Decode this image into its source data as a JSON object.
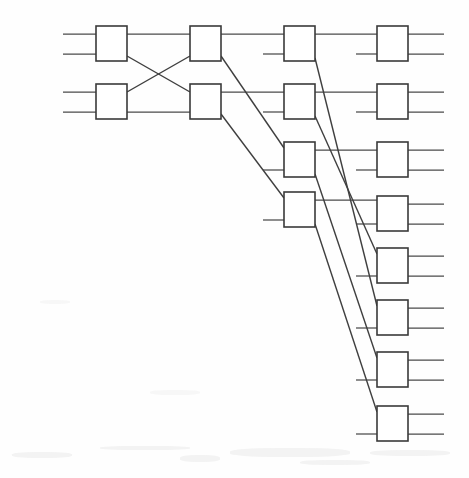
{
  "diagram": {
    "type": "switching-network",
    "background_color": "#fefefe",
    "line_color": "#4a4a4a",
    "box_stroke_color": "#3a3a3a",
    "box_fill_color": "#ffffff",
    "canvas": {
      "width": 469,
      "height": 478
    },
    "box_size": {
      "width": 31,
      "height": 35
    },
    "stub_length": 33,
    "columns": [
      {
        "name": "stage-1",
        "index": 1,
        "x": 96,
        "node_count": 2,
        "nodes": [
          {
            "id": "s1n1",
            "label": "",
            "x": 96,
            "y": 26
          },
          {
            "id": "s1n2",
            "label": "",
            "x": 96,
            "y": 84
          }
        ]
      },
      {
        "name": "stage-2",
        "index": 2,
        "x": 190,
        "node_count": 2,
        "nodes": [
          {
            "id": "s2n1",
            "label": "",
            "x": 190,
            "y": 26
          },
          {
            "id": "s2n2",
            "label": "",
            "x": 190,
            "y": 84
          }
        ]
      },
      {
        "name": "stage-3",
        "index": 3,
        "x": 284,
        "node_count": 4,
        "nodes": [
          {
            "id": "s3n1",
            "label": "",
            "x": 284,
            "y": 26
          },
          {
            "id": "s3n2",
            "label": "",
            "x": 284,
            "y": 84
          },
          {
            "id": "s3n3",
            "label": "",
            "x": 284,
            "y": 142
          },
          {
            "id": "s3n4",
            "label": "",
            "x": 284,
            "y": 192
          }
        ]
      },
      {
        "name": "stage-4",
        "index": 4,
        "x": 377,
        "node_count": 8,
        "nodes": [
          {
            "id": "s4n1",
            "label": "",
            "x": 377,
            "y": 26
          },
          {
            "id": "s4n2",
            "label": "",
            "x": 377,
            "y": 84
          },
          {
            "id": "s4n3",
            "label": "",
            "x": 377,
            "y": 142
          },
          {
            "id": "s4n4",
            "label": "",
            "x": 377,
            "y": 196
          },
          {
            "id": "s4n5",
            "label": "",
            "x": 377,
            "y": 248
          },
          {
            "id": "s4n6",
            "label": "",
            "x": 377,
            "y": 300
          },
          {
            "id": "s4n7",
            "label": "",
            "x": 377,
            "y": 352
          },
          {
            "id": "s4n8",
            "label": "",
            "x": 377,
            "y": 406
          }
        ]
      }
    ],
    "input_stubs": [
      {
        "name": "input-1a",
        "x1": 63,
        "y1": 34,
        "x2": 96,
        "y2": 34
      },
      {
        "name": "input-1b",
        "x1": 63,
        "y1": 54,
        "x2": 96,
        "y2": 54
      },
      {
        "name": "input-2a",
        "x1": 63,
        "y1": 92,
        "x2": 96,
        "y2": 92
      },
      {
        "name": "input-2b",
        "x1": 63,
        "y1": 112,
        "x2": 96,
        "y2": 112
      }
    ],
    "output_stubs": [
      {
        "name": "output-1a",
        "x1": 408,
        "y1": 34,
        "x2": 444,
        "y2": 34
      },
      {
        "name": "output-1b",
        "x1": 408,
        "y1": 54,
        "x2": 444,
        "y2": 54
      },
      {
        "name": "output-2a",
        "x1": 408,
        "y1": 92,
        "x2": 444,
        "y2": 92
      },
      {
        "name": "output-2b",
        "x1": 408,
        "y1": 112,
        "x2": 444,
        "y2": 112
      },
      {
        "name": "output-3a",
        "x1": 408,
        "y1": 150,
        "x2": 444,
        "y2": 150
      },
      {
        "name": "output-3b",
        "x1": 408,
        "y1": 170,
        "x2": 444,
        "y2": 170
      },
      {
        "name": "output-4a",
        "x1": 408,
        "y1": 204,
        "x2": 444,
        "y2": 204
      },
      {
        "name": "output-4b",
        "x1": 408,
        "y1": 224,
        "x2": 444,
        "y2": 224
      },
      {
        "name": "output-5a",
        "x1": 408,
        "y1": 256,
        "x2": 444,
        "y2": 256
      },
      {
        "name": "output-5b",
        "x1": 408,
        "y1": 276,
        "x2": 444,
        "y2": 276
      },
      {
        "name": "output-6a",
        "x1": 408,
        "y1": 308,
        "x2": 444,
        "y2": 308
      },
      {
        "name": "output-6b",
        "x1": 408,
        "y1": 328,
        "x2": 444,
        "y2": 328
      },
      {
        "name": "output-7a",
        "x1": 408,
        "y1": 360,
        "x2": 444,
        "y2": 360
      },
      {
        "name": "output-7b",
        "x1": 408,
        "y1": 380,
        "x2": 444,
        "y2": 380
      },
      {
        "name": "output-8a",
        "x1": 408,
        "y1": 414,
        "x2": 444,
        "y2": 414
      },
      {
        "name": "output-8b",
        "x1": 408,
        "y1": 434,
        "x2": 444,
        "y2": 434
      }
    ],
    "straight_links": [
      {
        "name": "link-s1n1-s2n1",
        "from": "s1n1",
        "to": "s2n1",
        "x1": 127,
        "y1": 34,
        "x2": 190,
        "y2": 34
      },
      {
        "name": "link-s1n2-s2n2",
        "from": "s1n2",
        "to": "s2n2",
        "x1": 127,
        "y1": 112,
        "x2": 190,
        "y2": 112
      },
      {
        "name": "link-s2n1-s3n1",
        "from": "s2n1",
        "to": "s3n1",
        "x1": 221,
        "y1": 34,
        "x2": 284,
        "y2": 34
      },
      {
        "name": "link-s2n2-s3n2",
        "from": "s2n2",
        "to": "s3n2",
        "x1": 221,
        "y1": 92,
        "x2": 284,
        "y2": 92
      },
      {
        "name": "link-s3n1-s4n1",
        "from": "s3n1",
        "to": "s4n1",
        "x1": 315,
        "y1": 34,
        "x2": 377,
        "y2": 34
      },
      {
        "name": "link-s3n2-s4n2",
        "from": "s3n2",
        "to": "s4n2",
        "x1": 315,
        "y1": 92,
        "x2": 377,
        "y2": 92
      },
      {
        "name": "link-s3n3-s4n3",
        "from": "s3n3",
        "to": "s4n3",
        "x1": 315,
        "y1": 150,
        "x2": 377,
        "y2": 150
      },
      {
        "name": "link-s3n4-s4n4",
        "from": "s3n4",
        "to": "s4n4",
        "x1": 315,
        "y1": 200,
        "x2": 377,
        "y2": 200
      },
      {
        "name": "stub-s3n1-in",
        "from": "",
        "to": "s3n1",
        "x1": 263,
        "y1": 54,
        "x2": 284,
        "y2": 54
      },
      {
        "name": "stub-s3n2-in",
        "from": "",
        "to": "s3n2",
        "x1": 263,
        "y1": 112,
        "x2": 284,
        "y2": 112
      },
      {
        "name": "stub-s3n3-in",
        "from": "",
        "to": "s3n3",
        "x1": 263,
        "y1": 170,
        "x2": 284,
        "y2": 170
      },
      {
        "name": "stub-s3n4-in",
        "from": "",
        "to": "s3n4",
        "x1": 263,
        "y1": 220,
        "x2": 284,
        "y2": 220
      },
      {
        "name": "stub-s4n1-in",
        "from": "",
        "to": "s4n1",
        "x1": 356,
        "y1": 54,
        "x2": 377,
        "y2": 54
      },
      {
        "name": "stub-s4n2-in",
        "from": "",
        "to": "s4n2",
        "x1": 356,
        "y1": 112,
        "x2": 377,
        "y2": 112
      },
      {
        "name": "stub-s4n3-in",
        "from": "",
        "to": "s4n3",
        "x1": 356,
        "y1": 170,
        "x2": 377,
        "y2": 170
      },
      {
        "name": "stub-s4n4-in",
        "from": "",
        "to": "s4n4",
        "x1": 356,
        "y1": 224,
        "x2": 377,
        "y2": 224
      },
      {
        "name": "stub-s4n5-in",
        "from": "",
        "to": "s4n5",
        "x1": 356,
        "y1": 276,
        "x2": 377,
        "y2": 276
      },
      {
        "name": "stub-s4n6-in",
        "from": "",
        "to": "s4n6",
        "x1": 356,
        "y1": 328,
        "x2": 377,
        "y2": 328
      },
      {
        "name": "stub-s4n7-in",
        "from": "",
        "to": "s4n7",
        "x1": 356,
        "y1": 380,
        "x2": 377,
        "y2": 380
      },
      {
        "name": "stub-s4n8-in",
        "from": "",
        "to": "s4n8",
        "x1": 356,
        "y1": 434,
        "x2": 377,
        "y2": 434
      }
    ],
    "cross_links": [
      {
        "name": "cross-s1n1-s2n2",
        "from": "s1n1",
        "to": "s2n2",
        "x1": 127,
        "y1": 56,
        "x2": 190,
        "y2": 92
      },
      {
        "name": "cross-s1n2-s2n1",
        "from": "s1n2",
        "to": "s2n1",
        "x1": 127,
        "y1": 92,
        "x2": 190,
        "y2": 56
      },
      {
        "name": "cross-s2n1-s3n3",
        "from": "s2n1",
        "to": "s3n3",
        "x1": 221,
        "y1": 56,
        "x2": 284,
        "y2": 148
      },
      {
        "name": "cross-s2n2-s3n4",
        "from": "s2n2",
        "to": "s3n4",
        "x1": 221,
        "y1": 114,
        "x2": 284,
        "y2": 198
      },
      {
        "name": "cross-s3n1-s4n6",
        "from": "s3n1",
        "to": "s4n6",
        "x1": 315,
        "y1": 58,
        "x2": 377,
        "y2": 306
      },
      {
        "name": "cross-s3n2-s4n5",
        "from": "s3n2",
        "to": "s4n5",
        "x1": 315,
        "y1": 116,
        "x2": 377,
        "y2": 254
      },
      {
        "name": "cross-s3n3-s4n7",
        "from": "s3n3",
        "to": "s4n7",
        "x1": 315,
        "y1": 174,
        "x2": 377,
        "y2": 358
      },
      {
        "name": "cross-s3n4-s4n8",
        "from": "s3n4",
        "to": "s4n8",
        "x1": 315,
        "y1": 224,
        "x2": 377,
        "y2": 412
      }
    ]
  }
}
